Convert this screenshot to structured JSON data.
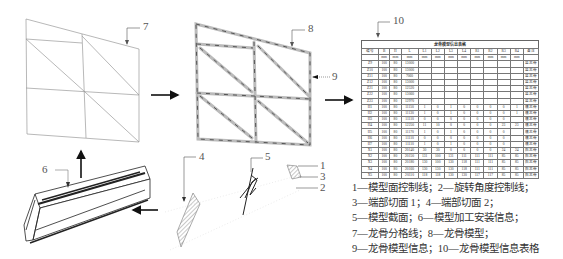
{
  "callouts": {
    "c1": "1",
    "c2": "2",
    "c3": "3",
    "c4": "4",
    "c5": "5",
    "c6": "6",
    "c7": "7",
    "c8": "8",
    "c9": "9",
    "c10": "10"
  },
  "table": {
    "title": "龙骨模型信息表格",
    "headers": [
      "编号",
      "B",
      "H",
      "L",
      "L1",
      "L2",
      "L3",
      "L4",
      "R1",
      "R2",
      "R3",
      "R4",
      "备注"
    ],
    "units": [
      "",
      "mm",
      "mm",
      "mm",
      "mm",
      "mm",
      "mm",
      "mm",
      "mm",
      "mm",
      "mm",
      "mm",
      ""
    ],
    "rows": [
      [
        "Z9",
        "100",
        "80",
        "13000",
        "",
        "",
        "",
        "",
        "",
        "",
        "",
        "",
        "竖龙骨"
      ],
      [
        "Z10",
        "100",
        "80",
        "13000",
        "",
        "",
        "",
        "",
        "",
        "",
        "",
        "",
        "竖龙骨"
      ],
      [
        "Z11",
        "100",
        "80",
        "7060",
        "",
        "",
        "",
        "",
        "",
        "",
        "",
        "",
        "竖龙骨"
      ],
      [
        "Z12",
        "100",
        "80",
        "13000",
        "",
        "",
        "",
        "",
        "",
        "",
        "",
        "",
        "竖龙骨"
      ],
      [
        "Z21",
        "100",
        "80",
        "12520",
        "",
        "",
        "",
        "",
        "",
        "",
        "",
        "",
        "竖龙骨"
      ],
      [
        "Z22",
        "100",
        "80",
        "13060",
        "",
        "",
        "",
        "",
        "",
        "",
        "",
        "",
        "竖龙骨"
      ],
      [
        "Z23",
        "100",
        "80",
        "12970",
        "",
        "",
        "",
        "",
        "",
        "",
        "",
        "",
        "竖龙骨"
      ],
      [
        "H1",
        "100",
        "80",
        "11150",
        "1",
        "0",
        "1",
        "0",
        "0",
        "0",
        "0",
        "1",
        "横龙骨"
      ],
      [
        "H2",
        "100",
        "80",
        "11130",
        "1",
        "0",
        "1",
        "0",
        "0",
        "0",
        "0",
        "1",
        "横龙骨"
      ],
      [
        "H3",
        "100",
        "80",
        "11110",
        "0",
        "0",
        "0",
        "0",
        "0",
        "0",
        "0",
        "",
        "横龙骨"
      ],
      [
        "H4",
        "100",
        "80",
        "12250",
        "11",
        "10",
        "0",
        "0",
        "0",
        "0",
        "23",
        "23",
        "横龙骨"
      ],
      [
        "H5",
        "100",
        "80",
        "11170",
        "1",
        "0",
        "1",
        "0",
        "0",
        "0",
        "0",
        "",
        "横龙骨"
      ],
      [
        "H6",
        "100",
        "80",
        "11110",
        "0",
        "0",
        "0",
        "0",
        "0",
        "0",
        "0",
        "",
        "横龙骨"
      ],
      [
        "H7",
        "100",
        "80",
        "11110",
        "1",
        "0",
        "1",
        "0",
        "0",
        "0",
        "0",
        "",
        "横龙骨"
      ],
      [
        "X1",
        "100",
        "80",
        "20140",
        "30",
        "30",
        "0",
        "0",
        "0",
        "0",
        "24",
        "24",
        "斜龙骨"
      ],
      [
        "X2",
        "100",
        "80",
        "20150",
        "131",
        "100",
        "131",
        "111",
        "111",
        "111",
        "85",
        "85",
        "斜龙骨"
      ],
      [
        "X3",
        "100",
        "80",
        "20180",
        "130",
        "100",
        "130",
        "118",
        "111",
        "111",
        "85",
        "85",
        "斜龙骨"
      ],
      [
        "X4",
        "100",
        "80",
        "20160",
        "130",
        "130",
        "130",
        "118",
        "111",
        "111",
        "85",
        "85",
        "斜龙骨"
      ],
      [
        "X5",
        "100",
        "80",
        "20110",
        "118",
        "118",
        "130",
        "130",
        "117",
        "117",
        "85",
        "85",
        "斜龙骨"
      ]
    ]
  },
  "legend": {
    "line1": "1—模型面控制线；2—旋转角度控制线；",
    "line2": "3—端部切面 1；4—端部切面 2；",
    "line3": "5—模型截面；6—模型加工安装信息；",
    "line4": "7—龙骨分格线；8—龙骨模型；",
    "line5": "9—龙骨模型信息；10—龙骨模型信息表格"
  }
}
